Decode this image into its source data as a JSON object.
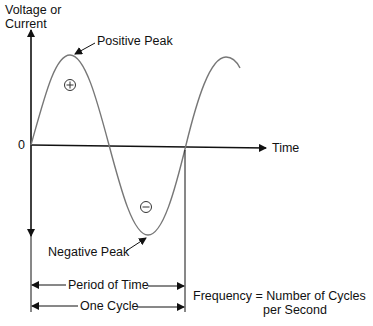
{
  "axis": {
    "y_label_line1": "Voltage or",
    "y_label_line2": "Current",
    "x_label": "Time",
    "zero_label": "0"
  },
  "annotations": {
    "positive_peak": "Positive Peak",
    "negative_peak": "Negative Peak",
    "plus_symbol": "+",
    "minus_symbol": "−"
  },
  "dimensions": {
    "period": "Period of Time",
    "cycle": "One Cycle"
  },
  "formula": {
    "line1": "Frequency = Number of Cycles",
    "line2": "per Second"
  },
  "colors": {
    "curve": "#777777",
    "axis": "#111111"
  }
}
